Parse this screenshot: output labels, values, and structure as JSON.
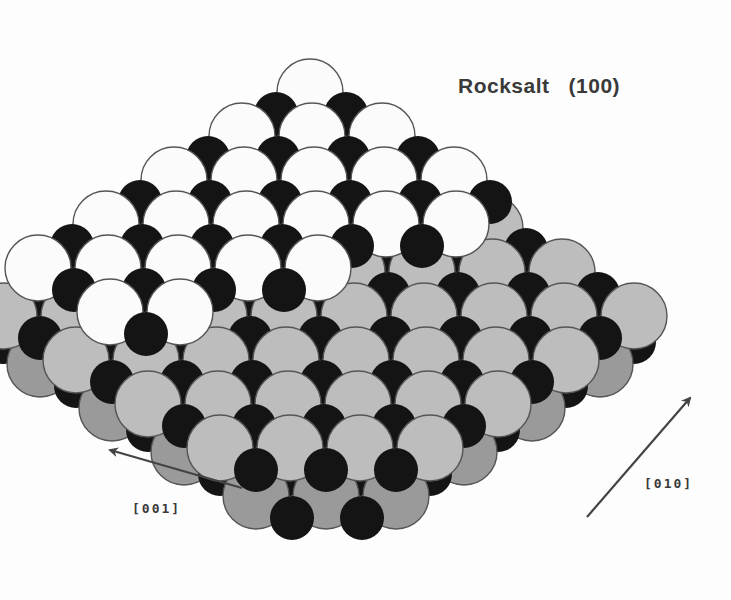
{
  "figure": {
    "title": "Rocksalt   (100)",
    "colors": {
      "background": "#fdfdfd",
      "anion_top_layer": "#fbfbfb",
      "anion_lower_layer": "#bdbdbd",
      "anion_lowest_layer": "#9a9a9a",
      "cation": "#141414",
      "outline": "#555555",
      "arrow": "#444444"
    }
  },
  "axes": [
    {
      "label": "[001]",
      "direction": "up-left"
    },
    {
      "label": "[010]",
      "direction": "up-right"
    }
  ],
  "layers": [
    {
      "name": "bottom-layer",
      "shade": "lowest"
    },
    {
      "name": "middle-layer",
      "shade": "lower"
    },
    {
      "name": "top-terrace",
      "shade": "top"
    }
  ]
}
